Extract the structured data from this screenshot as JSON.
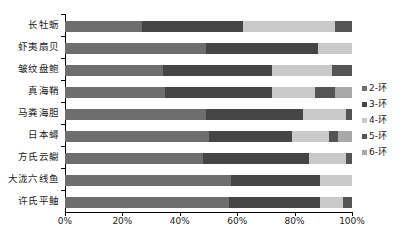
{
  "chart_data": {
    "type": "bar",
    "subtype": "stacked-percentage-horizontal",
    "title": "",
    "xlabel": "",
    "ylabel": "",
    "xlim": [
      0,
      100
    ],
    "xticks": [
      "0%",
      "20%",
      "40%",
      "60%",
      "80%",
      "100%"
    ],
    "xtick_values": [
      0,
      20,
      40,
      60,
      80,
      100
    ],
    "grid": false,
    "legend_position": "right",
    "categories": [
      "长牡蛎",
      "虾夷扇贝",
      "皱纹盘鲍",
      "真海鞘",
      "马粪海胆",
      "日本蟳",
      "方氏云鳚",
      "大泷六线鱼",
      "许氏平鲉"
    ],
    "series": [
      {
        "name": "2-环",
        "color": "#6e6e6e",
        "values": [
          27.0,
          49.0,
          34.0,
          35.0,
          49.0,
          50.0,
          48.0,
          58.0,
          57.0
        ]
      },
      {
        "name": "3-环",
        "color": "#454545",
        "values": [
          35.0,
          39.0,
          38.0,
          37.0,
          34.0,
          29.0,
          37.0,
          31.0,
          32.0
        ]
      },
      {
        "name": "4-环",
        "color": "#c9c9c9",
        "values": [
          32.0,
          12.0,
          21.0,
          15.0,
          15.0,
          13.0,
          13.0,
          11.0,
          8.0
        ]
      },
      {
        "name": "5-环",
        "color": "#545454",
        "values": [
          6.0,
          0.0,
          7.0,
          7.0,
          2.0,
          3.0,
          2.0,
          0.0,
          3.0
        ]
      },
      {
        "name": "6-环",
        "color": "#a8a8a8",
        "values": [
          0.0,
          0.0,
          0.0,
          6.0,
          0.0,
          5.0,
          0.0,
          0.0,
          0.0
        ]
      }
    ]
  },
  "legend": {
    "items": [
      {
        "label": "2-环",
        "color": "#6e6e6e"
      },
      {
        "label": "3-环",
        "color": "#454545"
      },
      {
        "label": "4-环",
        "color": "#c9c9c9"
      },
      {
        "label": "5-环",
        "color": "#545454"
      },
      {
        "label": "6-环",
        "color": "#a8a8a8"
      }
    ]
  },
  "caption": {
    "text": ""
  }
}
